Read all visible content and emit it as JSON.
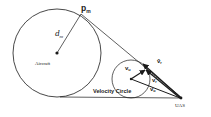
{
  "diagram": {
    "type": "collision-avoidance-geometry",
    "labels": {
      "aircraft": "Aircraft",
      "uas": "UAS",
      "velocity_circle": "Velocity Circle",
      "pm": "p",
      "pm_sub": "m",
      "dm": "d",
      "dm_sub": "m",
      "v_hat_r": "v̂",
      "v_hat_r_sub": "r",
      "v_u": "v",
      "v_u_sub": "u",
      "v_r": "v",
      "v_r_sub": "r",
      "v_o": "v",
      "v_o_sub": "o"
    },
    "colors": {
      "stroke": "#1a1a1a",
      "background": "#ffffff"
    }
  }
}
